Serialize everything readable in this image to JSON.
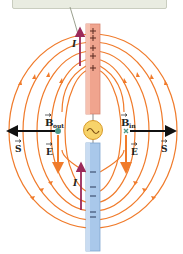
{
  "figure": {
    "callout": {
      "text": ""
    },
    "labels": {
      "B_out": {
        "symbol": "B",
        "sub": "out"
      },
      "B_in": {
        "symbol": "B",
        "sub": "in"
      },
      "E_left": "E",
      "E_right": "E",
      "S_left": "S",
      "S_right": "S",
      "I_top": "I",
      "I_bottom": "I"
    },
    "top_rod": {
      "charge": "+",
      "marks": 5,
      "color": "#f0a48e"
    },
    "bottom_rod": {
      "charge": "−",
      "marks": 5,
      "color": "#a9c8ea"
    },
    "source": {
      "symbol": "~",
      "color": "#f7d36a"
    },
    "colors": {
      "field_lines": "#f07b2b",
      "current_arrow": "#9c2a5a",
      "poynting_arrow": "#111111",
      "callout_bg": "#e9ece1"
    }
  }
}
